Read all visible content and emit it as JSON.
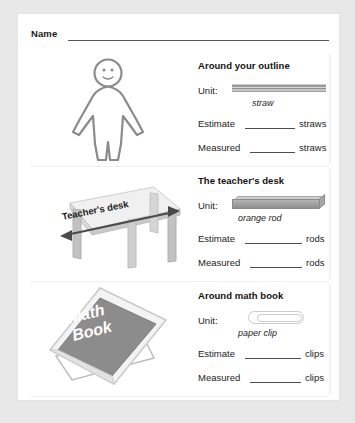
{
  "worksheet": {
    "name_label": "Name",
    "sections": [
      {
        "title": "Around your outline",
        "unit_label": "Unit:",
        "unit_caption": "straw",
        "unit_icon": "straw-icon",
        "art_icon": "body-outline-figure",
        "estimate_label": "Estimate",
        "measured_label": "Measured",
        "unit_word": "straws"
      },
      {
        "title": "The teacher's desk",
        "unit_label": "Unit:",
        "unit_caption": "orange rod",
        "unit_icon": "orange-rod-icon",
        "art_icon": "teachers-desk-illustration",
        "art_caption": "Teacher's desk",
        "estimate_label": "Estimate",
        "measured_label": "Measured",
        "unit_word": "rods"
      },
      {
        "title": "Around math book",
        "unit_label": "Unit:",
        "unit_caption": "paper clip",
        "unit_icon": "paper-clip-icon",
        "art_icon": "math-book-illustration",
        "art_text_line1": "Math",
        "art_text_line2": "Book",
        "estimate_label": "Estimate",
        "measured_label": "Measured",
        "unit_word": "clips"
      }
    ]
  }
}
